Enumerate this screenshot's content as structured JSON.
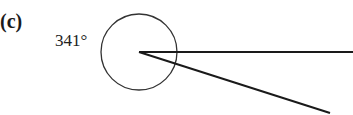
{
  "figure": {
    "part_label": "(c)",
    "angle_label": "341°",
    "angle_degrees": 341,
    "colors": {
      "stroke": "#1a1a1a",
      "circle": "#333333",
      "background": "#ffffff"
    },
    "geometry": {
      "vertex": [
        139,
        52
      ],
      "circle_radius": 38,
      "ray_horizontal_end": [
        353,
        52
      ],
      "ray_sloped_end": [
        330,
        113
      ]
    }
  }
}
